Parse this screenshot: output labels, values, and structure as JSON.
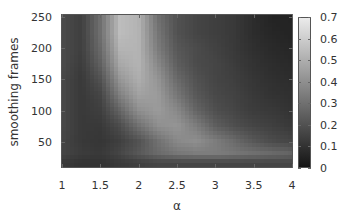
{
  "chart_data": {
    "type": "heatmap",
    "title": "",
    "xlabel": "α",
    "ylabel": "smoothing frames",
    "x_ticks": [
      "1",
      "1.5",
      "2",
      "2.5",
      "3",
      "3.5",
      "4"
    ],
    "y_ticks": [
      "50",
      "100",
      "150",
      "200",
      "250"
    ],
    "colorbar_ticks": [
      "0",
      "0.1",
      "0.2",
      "0.3",
      "0.4",
      "0.5",
      "0.6",
      "0.7"
    ],
    "xlim": [
      1,
      4
    ],
    "ylim": [
      8,
      255
    ],
    "clim": [
      0,
      0.7
    ],
    "colormap": "gray",
    "grid": false,
    "legend_position": "right colorbar",
    "x": [
      1.0,
      1.25,
      1.5,
      1.75,
      2.0,
      2.25,
      2.5,
      2.75,
      3.0,
      3.25,
      3.5,
      3.75,
      4.0
    ],
    "y": [
      250,
      225,
      200,
      175,
      150,
      125,
      100,
      75,
      50,
      30,
      15
    ],
    "z": [
      [
        0.18,
        0.14,
        0.3,
        0.55,
        0.52,
        0.3,
        0.2,
        0.16,
        0.14,
        0.12,
        0.08,
        0.05,
        0.05
      ],
      [
        0.18,
        0.14,
        0.3,
        0.55,
        0.52,
        0.32,
        0.2,
        0.16,
        0.14,
        0.12,
        0.08,
        0.06,
        0.05
      ],
      [
        0.18,
        0.14,
        0.28,
        0.52,
        0.52,
        0.34,
        0.22,
        0.18,
        0.15,
        0.12,
        0.09,
        0.07,
        0.06
      ],
      [
        0.18,
        0.13,
        0.25,
        0.48,
        0.52,
        0.38,
        0.24,
        0.18,
        0.16,
        0.13,
        0.1,
        0.08,
        0.07
      ],
      [
        0.17,
        0.12,
        0.2,
        0.42,
        0.5,
        0.42,
        0.28,
        0.2,
        0.16,
        0.14,
        0.11,
        0.09,
        0.08
      ],
      [
        0.17,
        0.12,
        0.16,
        0.35,
        0.46,
        0.44,
        0.32,
        0.22,
        0.17,
        0.15,
        0.12,
        0.1,
        0.09
      ],
      [
        0.17,
        0.12,
        0.14,
        0.26,
        0.4,
        0.44,
        0.38,
        0.26,
        0.19,
        0.16,
        0.13,
        0.12,
        0.1
      ],
      [
        0.17,
        0.12,
        0.12,
        0.18,
        0.3,
        0.4,
        0.42,
        0.34,
        0.24,
        0.19,
        0.16,
        0.14,
        0.12
      ],
      [
        0.16,
        0.12,
        0.11,
        0.14,
        0.2,
        0.3,
        0.38,
        0.4,
        0.34,
        0.28,
        0.22,
        0.18,
        0.16
      ],
      [
        0.16,
        0.13,
        0.12,
        0.16,
        0.22,
        0.28,
        0.32,
        0.34,
        0.34,
        0.32,
        0.3,
        0.28,
        0.26
      ],
      [
        0.12,
        0.1,
        0.1,
        0.12,
        0.14,
        0.16,
        0.16,
        0.16,
        0.16,
        0.16,
        0.16,
        0.16,
        0.16
      ]
    ]
  }
}
